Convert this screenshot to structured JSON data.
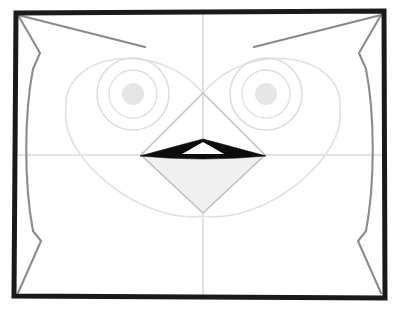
{
  "artwork": {
    "title": "Owl Face Construction Sketch",
    "medium": "pencil-sketch",
    "subject": "owl-head",
    "canvas": {
      "width": 400,
      "height": 311,
      "background": "#ffffff"
    }
  },
  "colors": {
    "frame_stroke": "#1a1a1a",
    "body_outline": "#8c8c8c",
    "ear_tuft": "#8a8a8a",
    "guideline": "#c9c9c9",
    "facial_disc": "#e2e2e2",
    "eye_ring_outer": "#dcdcdc",
    "eye_ring_inner": "#e0e0e0",
    "pupil_fill": "#e6e6e6",
    "beak_dark": "#0d0d0d",
    "beak_shade": "#f0f0f0",
    "beak_construction": "#bdbdbd",
    "paper": "#ffffff"
  },
  "frame": {
    "name": "drawing-border",
    "stroke_width": 5,
    "x": 14,
    "y": 11,
    "width": 371,
    "height": 287
  },
  "guides": {
    "vertical": {
      "x": 203,
      "y1": 13,
      "y2": 296,
      "label": "vertical-center-guide"
    },
    "horizontal": {
      "y": 155,
      "x1": 16,
      "x2": 383,
      "label": "horizontal-center-guide"
    }
  },
  "facial_disc": {
    "label": "heart-shaped-facial-disc",
    "apex": {
      "x": 203,
      "y": 93
    },
    "bottom": {
      "x": 203,
      "y": 213
    },
    "left_extent": 66,
    "right_extent": 340,
    "top_extent": 42
  },
  "eyes": [
    {
      "side": "left",
      "cx": 133,
      "cy": 94,
      "outer_r": 36,
      "inner_r": 24,
      "pupil_r": 11
    },
    {
      "side": "right",
      "cx": 266,
      "cy": 94,
      "outer_r": 36,
      "inner_r": 24,
      "pupil_r": 11
    }
  ],
  "beak": {
    "label": "beak-diamond",
    "top": {
      "x": 203,
      "y": 93
    },
    "left": {
      "x": 141,
      "y": 155
    },
    "right": {
      "x": 265,
      "y": 155
    },
    "bottom": {
      "x": 203,
      "y": 213
    },
    "mouth_line_label": "dark-beak-opening",
    "highlight_label": "beak-highlight-triangle"
  },
  "ear_tufts": [
    {
      "side": "left",
      "from": {
        "x": 18,
        "y": 15
      },
      "to": {
        "x": 145,
        "y": 47
      }
    },
    {
      "side": "right",
      "from": {
        "x": 381,
        "y": 15
      },
      "to": {
        "x": 254,
        "y": 47
      }
    }
  ],
  "body_outline": {
    "left_label": "left-body-contour",
    "right_label": "right-body-contour",
    "notch_top_y": 53,
    "notch_bottom_y": 241
  }
}
